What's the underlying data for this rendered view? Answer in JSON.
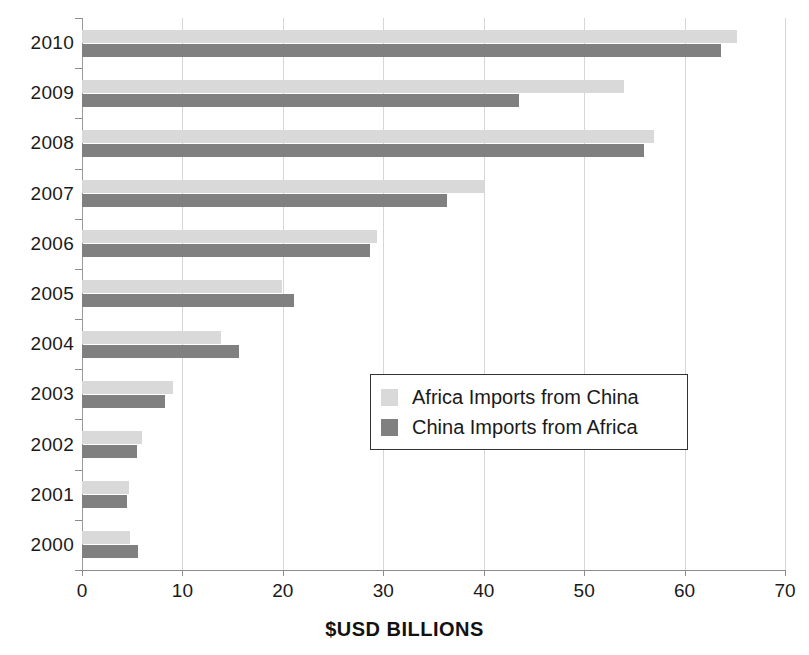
{
  "chart_data": {
    "type": "bar",
    "orientation": "horizontal",
    "title": "",
    "xlabel": "$USD BILLIONS",
    "ylabel": "",
    "xlim": [
      0,
      70
    ],
    "xticks": [
      0,
      10,
      20,
      30,
      40,
      50,
      60,
      70
    ],
    "grid": true,
    "legend_position": "center-right",
    "categories": [
      "2010",
      "2009",
      "2008",
      "2007",
      "2006",
      "2005",
      "2004",
      "2003",
      "2002",
      "2001",
      "2000"
    ],
    "series": [
      {
        "name": "Africa Imports from China",
        "color": "#d9d9d9",
        "values": [
          65.2,
          54.0,
          57.0,
          40.0,
          29.4,
          19.9,
          13.8,
          9.1,
          6.0,
          4.7,
          4.8
        ]
      },
      {
        "name": "China Imports from Africa",
        "color": "#808080",
        "values": [
          63.6,
          43.5,
          56.0,
          36.3,
          28.7,
          21.1,
          15.6,
          8.3,
          5.5,
          4.5,
          5.6
        ]
      }
    ]
  },
  "axis": {
    "x_title": "$USD BILLIONS",
    "x_tick_labels": [
      "0",
      "10",
      "20",
      "30",
      "40",
      "50",
      "60",
      "70"
    ],
    "y_tick_labels": [
      "2010",
      "2009",
      "2008",
      "2007",
      "2006",
      "2005",
      "2004",
      "2003",
      "2002",
      "2001",
      "2000"
    ]
  },
  "legend": {
    "items": [
      {
        "label": "Africa Imports from China",
        "swatch": "light"
      },
      {
        "label": "China Imports from Africa",
        "swatch": "dark"
      }
    ]
  },
  "colors": {
    "series_light": "#d9d9d9",
    "series_dark": "#808080",
    "gridline": "#d6d6d6",
    "axis": "#8c8c8c",
    "text": "#1a1a1a"
  }
}
